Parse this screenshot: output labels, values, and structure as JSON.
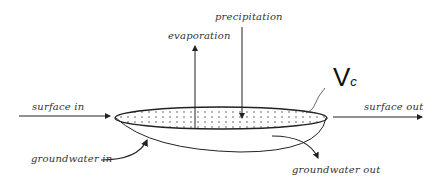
{
  "diagram": {
    "labels": {
      "evaporation": "evaporation",
      "precipitation": "precipitation",
      "surface_in": "surface in",
      "surface_out": "surface out",
      "groundwater_in": "groundwater in",
      "groundwater_out": "groundwater out",
      "volume_main": "V",
      "volume_sub": "c"
    },
    "colors": {
      "stroke": "#222222",
      "text": "#333333",
      "background": "#ffffff"
    }
  }
}
